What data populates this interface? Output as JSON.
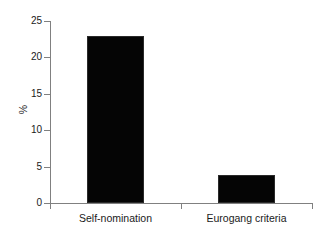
{
  "chart_data": {
    "type": "bar",
    "title": "",
    "xlabel": "",
    "ylabel": "%",
    "categories": [
      "Self-nomination",
      "Eurogang criteria"
    ],
    "values": [
      23,
      3.8
    ],
    "ylim": [
      0,
      25
    ],
    "yticks": [
      0,
      5,
      10,
      15,
      20,
      25
    ],
    "ytick_labels": [
      "0",
      "5",
      "10",
      "15",
      "20",
      "25"
    ],
    "grid": false,
    "legend": false,
    "bar_color": "#050505",
    "axis_color": "#808080",
    "background_color": "#ffffff"
  }
}
